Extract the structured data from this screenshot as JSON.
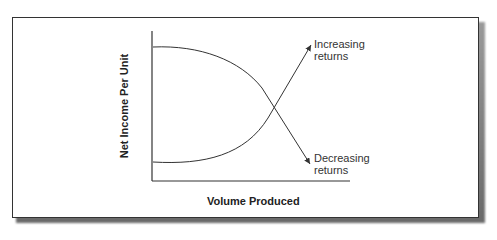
{
  "diagram": {
    "y_axis_label": "Net Income Per Unit",
    "x_axis_label": "Volume Produced",
    "curves": [
      {
        "name": "increasing-returns",
        "label_line1": "Increasing",
        "label_line2": "returns"
      },
      {
        "name": "decreasing-returns",
        "label_line1": "Decreasing",
        "label_line2": "returns"
      }
    ]
  },
  "colors": {
    "line": "#333333",
    "frame": "#333333",
    "shadow": "#777777"
  }
}
